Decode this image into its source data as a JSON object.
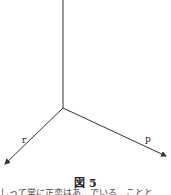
{
  "figure": {
    "caption": "図 5",
    "axes": [
      {
        "name": "vertical",
        "label": ""
      },
      {
        "name": "r",
        "label": "r"
      },
      {
        "name": "p",
        "label": "p"
      }
    ],
    "line_color": "#333333"
  },
  "body_text": "しって常に正恋はあ…でいる…ことと"
}
